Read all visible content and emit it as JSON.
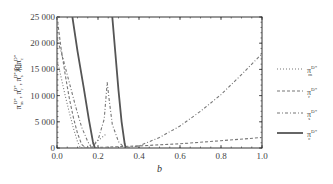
{
  "chart_data": {
    "type": "line",
    "title": "",
    "xlabel": "b",
    "ylabel": "π_m^{D*}, π_r^{D*}, π_s^{D*}和π_c^{D*}",
    "xlim": [
      0,
      1
    ],
    "ylim": [
      0,
      25000
    ],
    "x_ticks": [
      "0.0",
      "0.2",
      "0.4",
      "0.6",
      "0.8",
      "1.0"
    ],
    "y_ticks": [
      "0",
      "5 000",
      "10 000",
      "15 000",
      "20 000",
      "25 000"
    ],
    "grid": false,
    "legend_position": "right",
    "series": [
      {
        "name": "π_m^{D*}",
        "style": "dotted",
        "points": [
          [
            0.0,
            17000
          ],
          [
            0.02,
            13500
          ],
          [
            0.04,
            10000
          ],
          [
            0.06,
            6800
          ],
          [
            0.08,
            3800
          ],
          [
            0.1,
            1200
          ],
          [
            0.115,
            0
          ],
          [
            0.15,
            300
          ],
          [
            0.18,
            900
          ],
          [
            0.21,
            1700
          ],
          [
            0.24,
            2700
          ]
        ]
      },
      {
        "name": "π_r^{D*}",
        "style": "dashed",
        "points": [
          [
            0.0,
            25000
          ],
          [
            0.02,
            19000
          ],
          [
            0.04,
            14000
          ],
          [
            0.06,
            9500
          ],
          [
            0.08,
            5800
          ],
          [
            0.1,
            2800
          ],
          [
            0.12,
            700
          ],
          [
            0.14,
            0
          ],
          [
            0.2,
            100
          ],
          [
            0.4,
            400
          ],
          [
            0.6,
            800
          ],
          [
            0.8,
            1400
          ],
          [
            1.0,
            2000
          ]
        ]
      },
      {
        "name": "π_s^{D*}",
        "style": "dash-dot",
        "points": [
          [
            0.0,
            21000
          ],
          [
            0.03,
            17000
          ],
          [
            0.06,
            12500
          ],
          [
            0.09,
            8000
          ],
          [
            0.12,
            4000
          ],
          [
            0.15,
            1200
          ],
          [
            0.17,
            0
          ],
          [
            0.2,
            1500
          ],
          [
            0.23,
            5500
          ],
          [
            0.245,
            12500
          ],
          [
            0.255,
            9000
          ],
          [
            0.27,
            4500
          ],
          [
            0.3,
            1200
          ],
          [
            0.33,
            0
          ],
          [
            0.4,
            400
          ],
          [
            0.5,
            2000
          ],
          [
            0.6,
            4200
          ],
          [
            0.7,
            7000
          ],
          [
            0.8,
            10200
          ],
          [
            0.9,
            14000
          ],
          [
            1.0,
            18000
          ]
        ]
      },
      {
        "name": "π_c^{D*}",
        "style": "solid",
        "points": [
          [
            0.075,
            25000
          ],
          [
            0.1,
            18500
          ],
          [
            0.13,
            11500
          ],
          [
            0.155,
            5500
          ],
          [
            0.175,
            1200
          ],
          [
            0.185,
            0
          ]
        ],
        "points_branch2": [
          [
            0.27,
            25000
          ],
          [
            0.285,
            18000
          ],
          [
            0.3,
            11000
          ],
          [
            0.315,
            5000
          ],
          [
            0.33,
            800
          ],
          [
            0.335,
            0
          ]
        ]
      }
    ]
  },
  "legend": {
    "items": [
      {
        "base": "π",
        "sup": "D*",
        "sub": "m"
      },
      {
        "base": "π",
        "sup": "D*",
        "sub": "r"
      },
      {
        "base": "π",
        "sup": "D*",
        "sub": "s"
      },
      {
        "base": "π",
        "sup": "D*",
        "sub": "c"
      }
    ]
  },
  "axis": {
    "x_label": "b",
    "y_label_parts": [
      {
        "base": "π",
        "sub": "m",
        "sup": "D*",
        "sep": ", "
      },
      {
        "base": "π",
        "sub": "r",
        "sup": "D*",
        "sep": ", "
      },
      {
        "base": "π",
        "sub": "s",
        "sup": "D*",
        "sep": "和"
      },
      {
        "base": "π",
        "sub": "c",
        "sup": "D*",
        "sep": ""
      }
    ]
  },
  "colors": {
    "line": "#666666",
    "solid": "#555555",
    "frame": "#333333"
  }
}
